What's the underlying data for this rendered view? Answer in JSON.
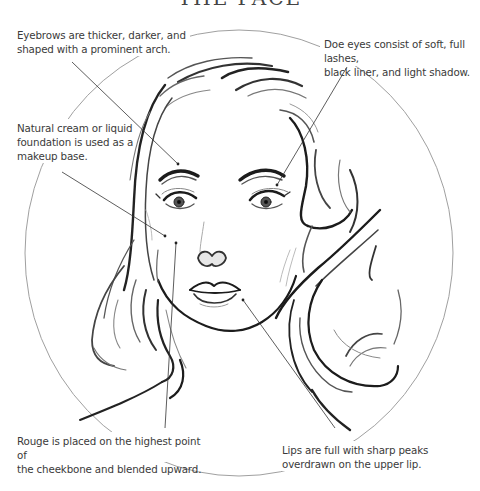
{
  "figure": {
    "title_fragment": "THE FACE",
    "frame_shape": "circle",
    "colors": {
      "text": "#3a3a3a",
      "leader_line": "#333333",
      "circle_frame": "#9a9a9a",
      "ink": "#1a1a1a"
    }
  },
  "annotations": [
    {
      "id": "eyebrows",
      "lines": [
        "Eyebrows are thicker, darker, and",
        "shaped with a prominent arch."
      ]
    },
    {
      "id": "doe-eyes",
      "lines": [
        "Doe eyes consist of soft, full lashes,",
        "black liner, and light shadow."
      ]
    },
    {
      "id": "foundation",
      "lines": [
        "Natural cream or liquid",
        "foundation is used as a",
        "makeup base."
      ]
    },
    {
      "id": "rouge",
      "lines": [
        "Rouge is placed on the highest point of",
        "the cheekbone and blended upward."
      ]
    },
    {
      "id": "lips",
      "lines": [
        "Lips are full with sharp peaks",
        "overdrawn on the upper lip."
      ]
    }
  ]
}
